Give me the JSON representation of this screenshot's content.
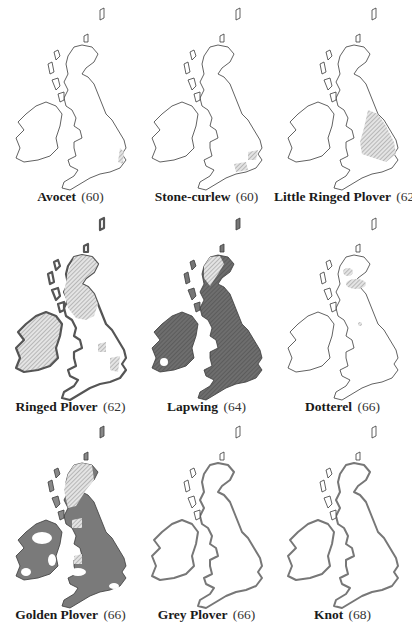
{
  "figure": {
    "panels": [
      {
        "species": "Avocet",
        "number": "(60)",
        "distribution": "small coastal patches East Anglia"
      },
      {
        "species": "Stone-curlew",
        "number": "(60)",
        "distribution": "patches in East Anglia and southern England"
      },
      {
        "species": "Little Ringed Plover",
        "number": "(62)",
        "distribution": "central and eastern England"
      },
      {
        "species": "Ringed Plover",
        "number": "(62)",
        "distribution": "coasts throughout, inland Scotland and Ireland"
      },
      {
        "species": "Lapwing",
        "number": "(64)",
        "distribution": "widespread throughout"
      },
      {
        "species": "Dotterel",
        "number": "(66)",
        "distribution": "Scottish highlands"
      },
      {
        "species": "Golden Plover",
        "number": "(66)",
        "distribution": "breeding in uplands; wintering widespread"
      },
      {
        "species": "Grey Plover",
        "number": "(66)",
        "distribution": "coasts (winter)"
      },
      {
        "species": "Knot",
        "number": "(68)",
        "distribution": "coasts (winter)"
      }
    ]
  },
  "colors": {
    "outline": "#3a3a3a",
    "dark_fill": "#7a7a7a",
    "hatch": "#9a9a9a",
    "background": "#ffffff"
  }
}
